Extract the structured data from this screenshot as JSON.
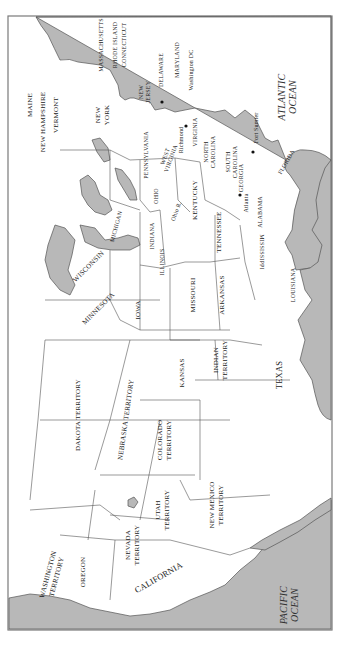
{
  "map": {
    "orientation": "rotated 90 degrees clockwise (north to the left)",
    "oceans": [
      {
        "id": "atlantic",
        "lines": [
          "ATLANTIC",
          "OCEAN"
        ]
      },
      {
        "id": "pacific",
        "lines": [
          "PACIFIC",
          "OCEAN"
        ]
      }
    ],
    "regions": [
      {
        "id": "maine",
        "lines": [
          "MAINE"
        ]
      },
      {
        "id": "new-hampshire",
        "lines": [
          "NEW HAMPSHIRE"
        ]
      },
      {
        "id": "vermont",
        "lines": [
          "VERMONT"
        ]
      },
      {
        "id": "massachusetts",
        "lines": [
          "MASSACHUSETTS"
        ]
      },
      {
        "id": "rhode-island",
        "lines": [
          "RHODE ISLAND"
        ]
      },
      {
        "id": "connecticut",
        "lines": [
          "CONNECTICUT"
        ]
      },
      {
        "id": "new-york",
        "lines": [
          "NEW",
          "YORK"
        ]
      },
      {
        "id": "new-jersey",
        "lines": [
          "NEW",
          "JERSEY"
        ]
      },
      {
        "id": "delaware",
        "lines": [
          "DELAWARE"
        ]
      },
      {
        "id": "maryland",
        "lines": [
          "MARYLAND"
        ]
      },
      {
        "id": "pennsylvania",
        "lines": [
          "PENNSYLVANIA"
        ]
      },
      {
        "id": "west-virginia",
        "lines": [
          "WEST",
          "VIRGINIA"
        ]
      },
      {
        "id": "virginia",
        "lines": [
          "VIRGINIA"
        ]
      },
      {
        "id": "north-carolina",
        "lines": [
          "NORTH",
          "CAROLINA"
        ]
      },
      {
        "id": "south-carolina",
        "lines": [
          "SOUTH",
          "CAROLINA"
        ]
      },
      {
        "id": "georgia",
        "lines": [
          "GEORGIA"
        ]
      },
      {
        "id": "florida",
        "lines": [
          "FLORIDA"
        ]
      },
      {
        "id": "ohio",
        "lines": [
          "OHIO"
        ]
      },
      {
        "id": "michigan",
        "lines": [
          "MICHIGAN"
        ]
      },
      {
        "id": "indiana",
        "lines": [
          "INDIANA"
        ]
      },
      {
        "id": "illinois",
        "lines": [
          "ILLINOIS"
        ]
      },
      {
        "id": "kentucky",
        "lines": [
          "KENTUCKY"
        ]
      },
      {
        "id": "tennessee",
        "lines": [
          "TENNESSEE"
        ]
      },
      {
        "id": "alabama",
        "lines": [
          "ALABAMA"
        ]
      },
      {
        "id": "mississippi",
        "lines": [
          "MISSISSIPPI"
        ]
      },
      {
        "id": "louisiana",
        "lines": [
          "LOUISIANA"
        ]
      },
      {
        "id": "wisconsin",
        "lines": [
          "WISCONSIN"
        ]
      },
      {
        "id": "minnesota",
        "lines": [
          "MINNESOTA"
        ]
      },
      {
        "id": "iowa",
        "lines": [
          "IOWA"
        ]
      },
      {
        "id": "missouri",
        "lines": [
          "MISSOURI"
        ]
      },
      {
        "id": "arkansas",
        "lines": [
          "ARKANSAS"
        ]
      },
      {
        "id": "kansas",
        "lines": [
          "KANSAS"
        ]
      },
      {
        "id": "indian-territory",
        "lines": [
          "INDIAN",
          "TERRITORY"
        ]
      },
      {
        "id": "texas",
        "lines": [
          "TEXAS"
        ]
      },
      {
        "id": "dakota-territory",
        "lines": [
          "DAKOTA TERRITORY"
        ]
      },
      {
        "id": "nebraska-territory",
        "lines": [
          "NEBRASKA TERRITORY"
        ]
      },
      {
        "id": "colorado-territory",
        "lines": [
          "COLORADO",
          "TERRITORY"
        ]
      },
      {
        "id": "utah-territory",
        "lines": [
          "UTAH",
          "TERRITORY"
        ]
      },
      {
        "id": "new-mexico-territory",
        "lines": [
          "NEW MEXICO",
          "TERRITORY"
        ]
      },
      {
        "id": "nevada-territory",
        "lines": [
          "NEVADA",
          "TERRITORY"
        ]
      },
      {
        "id": "washington-territory",
        "lines": [
          "WASHINGTON",
          "TERRITORY"
        ]
      },
      {
        "id": "oregon",
        "lines": [
          "OREGON"
        ]
      },
      {
        "id": "california",
        "lines": [
          "CALIFORNIA"
        ]
      }
    ],
    "rivers": [
      {
        "id": "ohio-river",
        "label": "Ohio R."
      }
    ],
    "cities": [
      {
        "id": "washington-dc",
        "label": "Washington DC"
      },
      {
        "id": "richmond",
        "label": "Richmond"
      },
      {
        "id": "fort-sumter",
        "label": "Fort Sumter"
      },
      {
        "id": "atlanta",
        "label": "Atlanta"
      }
    ],
    "colors": {
      "water": "#b8b8b8",
      "land": "#ffffff",
      "border": "#555555",
      "frame": "#7a7a7a"
    }
  }
}
